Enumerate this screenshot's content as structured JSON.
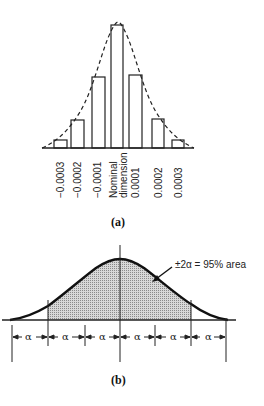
{
  "figure_a": {
    "caption": "(a)",
    "tick_labels": [
      "−0.0003",
      "−0.0002",
      "−0.0001",
      "Nominal",
      "dimension",
      "0.0001",
      "0.0002",
      "0.0003"
    ],
    "bars": [
      {
        "label": "−0.0003",
        "x": 54,
        "w": 13,
        "top": 140
      },
      {
        "label": "−0.0002",
        "x": 71,
        "w": 13,
        "top": 120
      },
      {
        "label": "−0.0001",
        "x": 92,
        "w": 13,
        "top": 77
      },
      {
        "label": "Nominal dimension",
        "x": 111,
        "w": 12,
        "top": 25
      },
      {
        "label": "0.0001",
        "x": 129,
        "w": 13,
        "top": 75
      },
      {
        "label": "0.0002",
        "x": 152,
        "w": 12,
        "top": 119
      },
      {
        "label": "0.0003",
        "x": 172,
        "w": 12,
        "top": 140
      }
    ],
    "curve_style": "dashed normal curve"
  },
  "figure_b": {
    "caption": "(b)",
    "annotation": "±2α = 95% area",
    "interval_label": "α",
    "intervals": 6,
    "shaded": "±2α region",
    "fill_color": "#bdbdbd"
  }
}
